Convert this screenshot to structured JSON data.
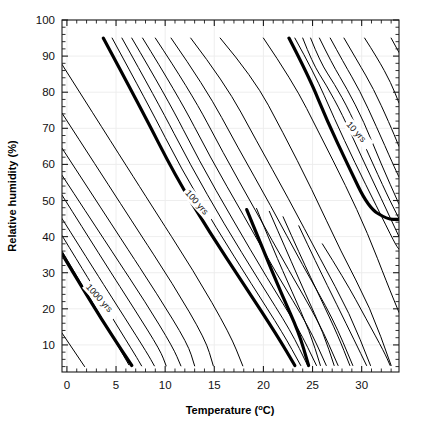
{
  "figure": {
    "background_color": "#ffffff",
    "line_color": "#000000",
    "grid_color": "#ececec",
    "text_color": "#111111"
  },
  "chart_data": {
    "type": "line",
    "title": "",
    "subtitle": "",
    "xlabel": "Temperature (",
    "xlabel_sup": "o",
    "xlabel_tail": "C)",
    "xlabel_full": "Temperature (°C)",
    "ylabel": "Relative humidity (%)",
    "xlim": [
      -0.5,
      33.8
    ],
    "ylim": [
      2.5,
      100
    ],
    "grid": true,
    "legend_position": "none",
    "x_ticks_major": [
      0,
      5,
      10,
      15,
      20,
      25,
      30
    ],
    "x_ticklabels": [
      "0",
      "5",
      "10",
      "15",
      "20",
      "25",
      "30"
    ],
    "x_tick_minor_step": 1,
    "y_ticks_major": [
      10,
      20,
      30,
      40,
      50,
      60,
      70,
      80,
      90,
      100
    ],
    "y_ticklabels": [
      "10",
      "20",
      "30",
      "40",
      "50",
      "60",
      "70",
      "80",
      "90",
      "100"
    ],
    "y_tick_minor_step": 2,
    "annotations": [
      {
        "text": "1000 yrs",
        "x": 1.9,
        "y": 26,
        "rotation": 48,
        "contour": "1000"
      },
      {
        "text": "100 yrs",
        "x": 12.0,
        "y": 52,
        "rotation": 48,
        "contour": "100"
      },
      {
        "text": "10 yrs",
        "x": 28.4,
        "y": 71,
        "rotation": 48,
        "contour": "10"
      }
    ],
    "contour_levels_bold": [
      "1000 yrs",
      "100 yrs",
      "10 yrs"
    ],
    "series": [
      {
        "name": "c01",
        "bold": false,
        "points": [
          [
            -0.5,
            13.3
          ],
          [
            1.8,
            4.0
          ]
        ]
      },
      {
        "name": "c02",
        "bold": false,
        "points": [
          [
            -0.5,
            36.0
          ],
          [
            2.0,
            24.5
          ],
          [
            4.3,
            14.0
          ],
          [
            6.3,
            4.5
          ]
        ]
      },
      {
        "name": "c03_1000yrs",
        "bold": true,
        "points": [
          [
            -0.5,
            35.2
          ],
          [
            2.4,
            22.0
          ],
          [
            4.6,
            12.6
          ],
          [
            6.6,
            4.3
          ]
        ]
      },
      {
        "name": "c04",
        "bold": false,
        "points": [
          [
            -0.5,
            40.3
          ],
          [
            2.6,
            26.5
          ],
          [
            5.0,
            15.8
          ],
          [
            7.0,
            7.0
          ],
          [
            7.6,
            4.2
          ]
        ]
      },
      {
        "name": "c05",
        "bold": false,
        "points": [
          [
            -0.5,
            45.0
          ],
          [
            3.2,
            29.0
          ],
          [
            5.9,
            17.5
          ],
          [
            8.2,
            7.6
          ],
          [
            8.9,
            4.2
          ]
        ]
      },
      {
        "name": "c06",
        "bold": false,
        "points": [
          [
            -0.5,
            51.5
          ],
          [
            3.9,
            32.5
          ],
          [
            6.9,
            19.8
          ],
          [
            9.5,
            8.5
          ],
          [
            10.1,
            4.2
          ]
        ]
      },
      {
        "name": "c07",
        "bold": false,
        "points": [
          [
            -0.5,
            57.0
          ],
          [
            4.7,
            35.4
          ],
          [
            8.0,
            21.8
          ],
          [
            10.8,
            9.3
          ],
          [
            11.6,
            4.2
          ]
        ]
      },
      {
        "name": "c08",
        "bold": false,
        "points": [
          [
            -0.5,
            64.5
          ],
          [
            5.6,
            39.0
          ],
          [
            9.2,
            24.0
          ],
          [
            12.3,
            10.3
          ],
          [
            13.0,
            4.2
          ]
        ]
      },
      {
        "name": "c09",
        "bold": false,
        "points": [
          [
            -0.5,
            74.2
          ],
          [
            6.8,
            43.5
          ],
          [
            10.8,
            26.8
          ],
          [
            14.1,
            11.5
          ],
          [
            14.9,
            4.2
          ]
        ]
      },
      {
        "name": "c10",
        "bold": false,
        "points": [
          [
            -0.5,
            87.7
          ],
          [
            8.4,
            49.5
          ],
          [
            12.9,
            30.5
          ],
          [
            16.6,
            13.0
          ],
          [
            17.9,
            4.2
          ]
        ]
      },
      {
        "name": "c11",
        "bold": true,
        "points": [
          [
            3.7,
            95.0
          ],
          [
            7.6,
            75.2
          ],
          [
            11.0,
            57.0
          ],
          [
            14.5,
            41.3
          ],
          [
            18.2,
            26.0
          ],
          [
            21.4,
            12.6
          ],
          [
            23.2,
            4.3
          ]
        ]
      },
      {
        "name": "c12",
        "bold": false,
        "points": [
          [
            4.6,
            95.0
          ],
          [
            8.3,
            76.5
          ],
          [
            11.7,
            58.5
          ],
          [
            15.2,
            42.4
          ],
          [
            18.8,
            26.8
          ],
          [
            22.0,
            13.2
          ],
          [
            23.8,
            4.3
          ]
        ]
      },
      {
        "name": "c13",
        "bold": false,
        "points": [
          [
            5.6,
            95.0
          ],
          [
            9.2,
            77.5
          ],
          [
            12.6,
            59.7
          ],
          [
            16.0,
            43.5
          ],
          [
            19.6,
            27.6
          ],
          [
            22.8,
            13.8
          ],
          [
            24.5,
            4.3
          ]
        ]
      },
      {
        "name": "c14",
        "bold": false,
        "points": [
          [
            6.6,
            95.0
          ],
          [
            10.2,
            78.4
          ],
          [
            13.5,
            60.8
          ],
          [
            16.9,
            44.6
          ],
          [
            20.4,
            28.4
          ],
          [
            23.6,
            14.4
          ],
          [
            25.4,
            4.3
          ]
        ]
      },
      {
        "name": "c15",
        "bold": false,
        "points": [
          [
            7.7,
            95.0
          ],
          [
            11.3,
            79.2
          ],
          [
            14.6,
            61.9
          ],
          [
            18.0,
            45.8
          ],
          [
            21.4,
            29.4
          ],
          [
            24.6,
            15.1
          ],
          [
            26.4,
            4.3
          ]
        ]
      },
      {
        "name": "c16",
        "bold": false,
        "points": [
          [
            9.0,
            95.0
          ],
          [
            12.6,
            80.2
          ],
          [
            15.9,
            63.2
          ],
          [
            19.2,
            47.2
          ],
          [
            22.6,
            30.6
          ],
          [
            25.7,
            16.0
          ],
          [
            27.6,
            4.3
          ]
        ]
      },
      {
        "name": "c17",
        "bold": false,
        "points": [
          [
            10.6,
            95.0
          ],
          [
            14.1,
            81.3
          ],
          [
            17.4,
            64.7
          ],
          [
            20.7,
            48.8
          ],
          [
            24.0,
            32.0
          ],
          [
            27.1,
            17.2
          ],
          [
            29.1,
            4.3
          ]
        ]
      },
      {
        "name": "c18",
        "bold": false,
        "points": [
          [
            12.6,
            95.0
          ],
          [
            16.1,
            82.5
          ],
          [
            19.3,
            66.5
          ],
          [
            22.5,
            50.8
          ],
          [
            25.8,
            33.8
          ],
          [
            28.8,
            18.6
          ],
          [
            30.9,
            4.3
          ]
        ]
      },
      {
        "name": "c19",
        "bold": false,
        "points": [
          [
            15.6,
            95.0
          ],
          [
            19.0,
            84.0
          ],
          [
            22.0,
            68.8
          ],
          [
            24.9,
            53.3
          ],
          [
            27.9,
            35.8
          ],
          [
            30.9,
            20.2
          ],
          [
            33.0,
            4.3
          ]
        ]
      },
      {
        "name": "c20_10yrs",
        "bold": true,
        "points": [
          [
            22.6,
            95.0
          ],
          [
            24.6,
            84.5
          ],
          [
            26.5,
            72.0
          ],
          [
            28.6,
            59.8
          ],
          [
            30.7,
            48.0
          ],
          [
            32.6,
            44.8
          ],
          [
            33.8,
            44.8
          ]
        ]
      },
      {
        "name": "c21",
        "bold": false,
        "points": [
          [
            23.2,
            95.0
          ],
          [
            25.2,
            85.2
          ],
          [
            27.2,
            72.8
          ],
          [
            29.3,
            60.5
          ],
          [
            31.5,
            48.5
          ],
          [
            33.4,
            38.0
          ],
          [
            33.8,
            36.5
          ]
        ]
      },
      {
        "name": "c22",
        "bold": false,
        "points": [
          [
            24.0,
            95.0
          ],
          [
            25.0,
            88.0
          ],
          [
            26.4,
            82.0
          ],
          [
            28.0,
            74.0
          ],
          [
            30.0,
            62.0
          ],
          [
            32.0,
            50.5
          ],
          [
            33.8,
            40.0
          ]
        ]
      },
      {
        "name": "c23",
        "bold": false,
        "points": [
          [
            24.8,
            95.0
          ],
          [
            25.8,
            88.2
          ],
          [
            27.2,
            82.4
          ],
          [
            28.8,
            74.6
          ],
          [
            30.7,
            62.8
          ],
          [
            32.6,
            51.5
          ],
          [
            33.8,
            45.0
          ]
        ]
      },
      {
        "name": "c24",
        "bold": false,
        "points": [
          [
            25.7,
            95.0
          ],
          [
            27.0,
            87.8
          ],
          [
            28.5,
            81.0
          ],
          [
            30.2,
            72.0
          ],
          [
            32.0,
            60.0
          ],
          [
            33.8,
            49.0
          ]
        ]
      },
      {
        "name": "c25",
        "bold": false,
        "points": [
          [
            26.8,
            95.0
          ],
          [
            28.2,
            88.0
          ],
          [
            29.8,
            80.5
          ],
          [
            31.5,
            70.5
          ],
          [
            33.2,
            60.0
          ],
          [
            33.8,
            56.5
          ]
        ]
      },
      {
        "name": "c26",
        "bold": false,
        "points": [
          [
            28.2,
            95.0
          ],
          [
            29.6,
            88.5
          ],
          [
            31.2,
            81.0
          ],
          [
            32.8,
            71.5
          ],
          [
            33.8,
            65.0
          ]
        ]
      },
      {
        "name": "c27",
        "bold": false,
        "points": [
          [
            30.3,
            95.0
          ],
          [
            31.6,
            89.5
          ],
          [
            33.0,
            82.5
          ],
          [
            33.8,
            77.0
          ]
        ]
      },
      {
        "name": "c28",
        "bold": false,
        "points": [
          [
            33.0,
            95.0
          ],
          [
            33.8,
            91.0
          ]
        ]
      },
      {
        "name": "c29",
        "bold": false,
        "points": [
          [
            20.0,
            95.0
          ],
          [
            23.0,
            83.0
          ],
          [
            25.8,
            68.0
          ],
          [
            28.4,
            54.0
          ],
          [
            30.6,
            41.0
          ],
          [
            32.6,
            27.0
          ],
          [
            33.8,
            19.0
          ]
        ]
      },
      {
        "name": "c30",
        "bold": false,
        "points": [
          [
            26.0,
            38.0
          ],
          [
            28.3,
            28.0
          ],
          [
            30.5,
            17.0
          ],
          [
            32.3,
            8.0
          ],
          [
            32.9,
            4.3
          ]
        ]
      },
      {
        "name": "c31",
        "bold": false,
        "points": [
          [
            23.6,
            43.0
          ],
          [
            25.5,
            32.0
          ],
          [
            27.5,
            21.0
          ],
          [
            29.3,
            11.0
          ],
          [
            30.5,
            4.3
          ]
        ]
      },
      {
        "name": "c32",
        "bold": false,
        "points": [
          [
            22.0,
            45.5
          ],
          [
            23.8,
            34.5
          ],
          [
            25.8,
            23.0
          ],
          [
            27.6,
            12.5
          ],
          [
            28.8,
            4.3
          ]
        ]
      },
      {
        "name": "c33",
        "bold": false,
        "points": [
          [
            20.6,
            47.0
          ],
          [
            22.4,
            35.8
          ],
          [
            24.3,
            24.0
          ],
          [
            26.1,
            13.3
          ],
          [
            27.2,
            4.3
          ]
        ]
      },
      {
        "name": "c34",
        "bold": false,
        "points": [
          [
            19.3,
            47.8
          ],
          [
            21.0,
            36.5
          ],
          [
            22.9,
            24.8
          ],
          [
            24.7,
            13.8
          ],
          [
            25.8,
            4.3
          ]
        ]
      },
      {
        "name": "c35",
        "bold": true,
        "points": [
          [
            18.3,
            47.5
          ],
          [
            20.0,
            36.2
          ],
          [
            21.8,
            24.4
          ],
          [
            23.6,
            13.5
          ],
          [
            24.6,
            4.3
          ]
        ]
      }
    ]
  }
}
